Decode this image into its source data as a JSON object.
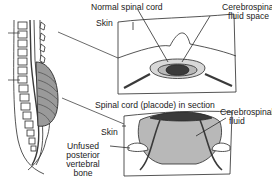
{
  "diagram": {
    "panels": [
      {
        "id": "normal-section",
        "title": "Normal spinal cord",
        "labels": {
          "normal_cord": "Normal spinal cord",
          "skin": "Skin",
          "csf_line1": "Cerebrospinal",
          "csf_line2": "fluid space"
        }
      },
      {
        "id": "placode-section",
        "title": "Spinal cord (placode) in section",
        "labels": {
          "placode": "Spinal cord (placode) in section",
          "skin": "Skin",
          "csf_line1": "Cerebrospinal",
          "csf_line2": "fluid",
          "bone_line1": "Unfused",
          "bone_line2": "posterior",
          "bone_line3": "vertebral",
          "bone_line4": "bone"
        }
      }
    ],
    "colors": {
      "line": "#2a2a2a",
      "cord_dark": "#3a3a3a",
      "csf_gray": "#b8b8b8",
      "sac_gray": "#9a9a9a",
      "background": "#ffffff"
    }
  }
}
